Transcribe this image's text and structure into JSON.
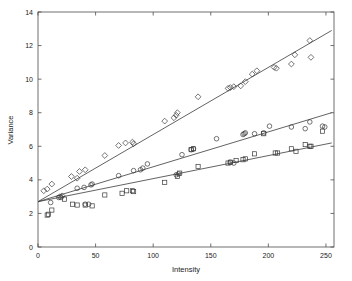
{
  "chart_data": {
    "type": "scatter",
    "title": "",
    "xlabel": "Intensity",
    "ylabel": "Variance",
    "xlim": [
      0,
      257
    ],
    "ylim": [
      0,
      14
    ],
    "xticks": [
      0,
      50,
      100,
      150,
      200,
      250
    ],
    "yticks": [
      0,
      2,
      4,
      6,
      8,
      10,
      12,
      14
    ],
    "grid": false,
    "legend": "none",
    "series": [
      {
        "name": "diamond-series",
        "marker": "diamond",
        "points": [
          [
            5,
            3.35
          ],
          [
            8,
            3.45
          ],
          [
            12,
            3.75
          ],
          [
            19,
            3.0
          ],
          [
            21,
            3.05
          ],
          [
            29,
            4.2
          ],
          [
            34,
            4.1
          ],
          [
            36,
            4.5
          ],
          [
            41,
            4.6
          ],
          [
            58,
            5.45
          ],
          [
            70,
            6.05
          ],
          [
            76,
            6.2
          ],
          [
            82,
            6.25
          ],
          [
            83,
            6.15
          ],
          [
            110,
            7.5
          ],
          [
            118,
            7.7
          ],
          [
            120,
            7.85
          ],
          [
            121,
            8.0
          ],
          [
            139,
            8.95
          ],
          [
            165,
            9.45
          ],
          [
            167,
            9.5
          ],
          [
            170,
            9.55
          ],
          [
            176,
            9.6
          ],
          [
            180,
            9.85
          ],
          [
            186,
            10.3
          ],
          [
            190,
            10.5
          ],
          [
            205,
            10.7
          ],
          [
            207,
            10.65
          ],
          [
            220,
            10.9
          ],
          [
            223,
            11.45
          ],
          [
            236,
            12.3
          ],
          [
            237,
            11.3
          ]
        ],
        "fit_line": {
          "x0": 0,
          "y0": 2.7,
          "x1": 255,
          "y1": 12.9
        }
      },
      {
        "name": "circle-series",
        "marker": "circle",
        "points": [
          [
            11,
            2.65
          ],
          [
            18,
            2.95
          ],
          [
            20,
            2.95
          ],
          [
            34,
            3.5
          ],
          [
            40,
            3.55
          ],
          [
            41,
            2.55
          ],
          [
            44,
            2.55
          ],
          [
            46,
            3.7
          ],
          [
            47,
            3.75
          ],
          [
            70,
            4.25
          ],
          [
            83,
            4.55
          ],
          [
            89,
            4.6
          ],
          [
            91,
            4.7
          ],
          [
            95,
            4.95
          ],
          [
            120,
            4.3
          ],
          [
            122,
            4.35
          ],
          [
            125,
            5.5
          ],
          [
            133,
            5.8
          ],
          [
            135,
            5.85
          ],
          [
            155,
            6.45
          ],
          [
            167,
            5.05
          ],
          [
            170,
            5.0
          ],
          [
            178,
            6.7
          ],
          [
            179,
            6.75
          ],
          [
            180,
            6.8
          ],
          [
            188,
            6.75
          ],
          [
            196,
            6.8
          ],
          [
            201,
            7.2
          ],
          [
            220,
            7.15
          ],
          [
            232,
            7.05
          ],
          [
            236,
            7.45
          ],
          [
            247,
            7.2
          ],
          [
            249,
            7.15
          ]
        ],
        "fit_line": {
          "x0": 0,
          "y0": 2.7,
          "x1": 255,
          "y1": 8.0
        }
      },
      {
        "name": "square-series",
        "marker": "square",
        "points": [
          [
            8,
            1.9
          ],
          [
            9,
            1.95
          ],
          [
            12,
            2.2
          ],
          [
            23,
            2.85
          ],
          [
            30,
            2.55
          ],
          [
            34,
            2.5
          ],
          [
            41,
            2.5
          ],
          [
            47,
            2.45
          ],
          [
            58,
            3.1
          ],
          [
            73,
            3.2
          ],
          [
            77,
            3.35
          ],
          [
            82,
            3.35
          ],
          [
            83,
            3.3
          ],
          [
            110,
            3.85
          ],
          [
            121,
            4.2
          ],
          [
            123,
            4.4
          ],
          [
            133,
            5.8
          ],
          [
            135,
            5.85
          ],
          [
            139,
            4.8
          ],
          [
            165,
            5.0
          ],
          [
            167,
            5.05
          ],
          [
            172,
            5.15
          ],
          [
            178,
            5.2
          ],
          [
            180,
            5.25
          ],
          [
            188,
            5.55
          ],
          [
            196,
            6.75
          ],
          [
            206,
            5.6
          ],
          [
            208,
            5.6
          ],
          [
            220,
            5.85
          ],
          [
            224,
            5.7
          ],
          [
            232,
            6.1
          ],
          [
            236,
            6.0
          ],
          [
            237,
            6.0
          ],
          [
            247,
            6.9
          ]
        ],
        "fit_line": {
          "x0": 0,
          "y0": 2.7,
          "x1": 255,
          "y1": 6.2
        }
      }
    ]
  }
}
